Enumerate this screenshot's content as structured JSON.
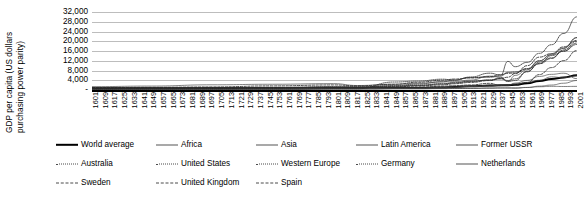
{
  "chart_data": {
    "type": "line",
    "title": "",
    "xlabel": "",
    "ylabel": "GDP per capita (US dollars purchasing power parity)",
    "ylabel_lines": [
      "GDP per capita (US dollars",
      "purchasing power parity)"
    ],
    "ylim": [
      0,
      32000
    ],
    "ytick_values": [
      0,
      4000,
      8000,
      12000,
      16000,
      20000,
      24000,
      28000,
      32000
    ],
    "ytick_labels": [
      "-",
      "4,000",
      "8,000",
      "12,000",
      "16,000",
      "20,000",
      "24,000",
      "28,000",
      "32,000"
    ],
    "grid": true,
    "legend_position": "bottom",
    "xlim": [
      1601,
      2001
    ],
    "x_tick_step": 8,
    "xtick_labels": [
      "1601",
      "1609",
      "1617",
      "1625",
      "1633",
      "1641",
      "1649",
      "1657",
      "1665",
      "1673",
      "1681",
      "1689",
      "1697",
      "1705",
      "1713",
      "1721",
      "1729",
      "1737",
      "1745",
      "1753",
      "1761",
      "1769",
      "1777",
      "1785",
      "1793",
      "1801",
      "1809",
      "1817",
      "1825",
      "1833",
      "1841",
      "1849",
      "1857",
      "1865",
      "1873",
      "1881",
      "1889",
      "1897",
      "1905",
      "1913",
      "1921",
      "1929",
      "1937",
      "1945",
      "1953",
      "1961",
      "1969",
      "1977",
      "1985",
      "1993",
      "2001"
    ],
    "x": [
      1601,
      1650,
      1700,
      1750,
      1800,
      1820,
      1850,
      1870,
      1890,
      1900,
      1913,
      1929,
      1938,
      1944,
      1950,
      1960,
      1970,
      1980,
      1990,
      2001
    ],
    "series": [
      {
        "name": "World average",
        "style": "solid-thick",
        "values": [
          580,
          600,
          620,
          650,
          670,
          670,
          800,
          870,
          1050,
          1260,
          1520,
          1800,
          1900,
          2000,
          2110,
          2770,
          3730,
          4520,
          5150,
          6050
        ]
      },
      {
        "name": "Africa",
        "style": "solid",
        "values": [
          410,
          420,
          430,
          440,
          420,
          420,
          440,
          500,
          560,
          600,
          640,
          750,
          850,
          880,
          890,
          1060,
          1340,
          1510,
          1440,
          1490
        ]
      },
      {
        "name": "Asia",
        "style": "solid",
        "values": [
          560,
          570,
          580,
          580,
          580,
          580,
          600,
          550,
          620,
          640,
          700,
          790,
          820,
          800,
          720,
          1030,
          1580,
          2030,
          2780,
          3900
        ]
      },
      {
        "name": "Latin America",
        "style": "solid",
        "values": [
          440,
          450,
          520,
          540,
          680,
          690,
          680,
          700,
          930,
          1110,
          1480,
          1930,
          1850,
          2100,
          2500,
          3140,
          4000,
          5400,
          5050,
          5800
        ]
      },
      {
        "name": "Former USSR",
        "style": "solid",
        "values": [
          550,
          560,
          610,
          640,
          690,
          690,
          940,
          940,
          1100,
          1240,
          1490,
          1390,
          2150,
          1900,
          2840,
          3940,
          5570,
          6430,
          6890,
          4630
        ]
      },
      {
        "name": "Australia",
        "style": "dotted",
        "values": [
          400,
          400,
          400,
          400,
          520,
          520,
          3270,
          3650,
          4430,
          4020,
          5160,
          5260,
          5730,
          7250,
          7410,
          8790,
          12020,
          14410,
          17040,
          21540
        ]
      },
      {
        "name": "United States",
        "style": "dotted",
        "values": [
          400,
          500,
          530,
          730,
          1260,
          1260,
          1810,
          2450,
          3390,
          4090,
          5300,
          6900,
          6130,
          11720,
          9560,
          11330,
          15030,
          18580,
          23200,
          30000
        ]
      },
      {
        "name": "Western Europe",
        "style": "dotted",
        "values": [
          800,
          850,
          1000,
          1060,
          1230,
          1230,
          1650,
          2000,
          2600,
          2890,
          3470,
          4120,
          4540,
          3900,
          4570,
          7460,
          11410,
          13200,
          15960,
          19250
        ]
      },
      {
        "name": "Germany",
        "style": "dotted",
        "values": [
          790,
          830,
          910,
          1050,
          1080,
          1080,
          1430,
          1840,
          2430,
          2990,
          3650,
          4050,
          4990,
          3500,
          3880,
          7700,
          10840,
          14110,
          15930,
          18680
        ]
      },
      {
        "name": "Netherlands",
        "style": "solid",
        "values": [
          1380,
          1620,
          2130,
          2360,
          2610,
          1840,
          2370,
          2760,
          3320,
          3420,
          4050,
          5690,
          5250,
          3500,
          5990,
          8290,
          11970,
          14710,
          17260,
          21480
        ]
      },
      {
        "name": "Sweden",
        "style": "dashed",
        "values": [
          700,
          820,
          950,
          1010,
          1170,
          1200,
          1290,
          1660,
          2080,
          2560,
          3100,
          3870,
          4730,
          5250,
          6740,
          9990,
          13490,
          14940,
          17700,
          20320
        ]
      },
      {
        "name": "United Kingdom",
        "style": "dashed",
        "values": [
          980,
          1100,
          1250,
          1690,
          2080,
          1710,
          2330,
          3190,
          4010,
          4490,
          4920,
          5500,
          6270,
          6850,
          6940,
          8650,
          10770,
          12930,
          16430,
          20080
        ]
      },
      {
        "name": "Spain",
        "style": "dashed",
        "values": [
          900,
          880,
          880,
          910,
          1060,
          1010,
          1080,
          1210,
          1510,
          1790,
          2060,
          2740,
          1790,
          2100,
          2190,
          3070,
          6320,
          9200,
          12050,
          16180
        ]
      }
    ]
  },
  "legend": {
    "rows": [
      [
        {
          "label": "World average",
          "style": "solid-thick"
        },
        {
          "label": "Africa",
          "style": "solid"
        },
        {
          "label": "Asia",
          "style": "solid"
        },
        {
          "label": "Latin America",
          "style": "solid"
        },
        {
          "label": "Former USSR",
          "style": "solid"
        }
      ],
      [
        {
          "label": "Australia",
          "style": "dotted"
        },
        {
          "label": "United States",
          "style": "dotted"
        },
        {
          "label": "Western Europe",
          "style": "dotted"
        },
        {
          "label": "Germany",
          "style": "dotted"
        },
        {
          "label": "Netherlands",
          "style": "solid"
        }
      ],
      [
        {
          "label": "Sweden",
          "style": "dashed"
        },
        {
          "label": "United Kingdom",
          "style": "dashed"
        },
        {
          "label": "Spain",
          "style": "dashed"
        }
      ]
    ]
  },
  "colors": {
    "axis": "#000000",
    "grid": "#bdbdbd",
    "series_primary": "#000000",
    "series_secondary": "#555555"
  }
}
